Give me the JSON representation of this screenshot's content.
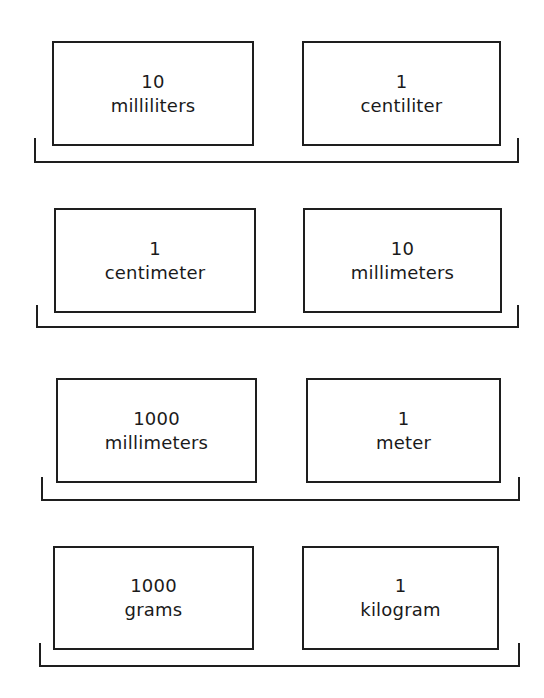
{
  "diagram": {
    "type": "metric-equivalence-pairs",
    "rows": [
      {
        "left": {
          "quantity": "10",
          "unit": "milliliters"
        },
        "right": {
          "quantity": "1",
          "unit": "centiliter"
        }
      },
      {
        "left": {
          "quantity": "1",
          "unit": "centimeter"
        },
        "right": {
          "quantity": "10",
          "unit": "millimeters"
        }
      },
      {
        "left": {
          "quantity": "1000",
          "unit": "millimeters"
        },
        "right": {
          "quantity": "1",
          "unit": "meter"
        }
      },
      {
        "left": {
          "quantity": "1000",
          "unit": "grams"
        },
        "right": {
          "quantity": "1",
          "unit": "kilogram"
        }
      }
    ],
    "colors": {
      "line": "#1e1e1e",
      "text": "#1a1a1a",
      "background": "#ffffff"
    }
  }
}
